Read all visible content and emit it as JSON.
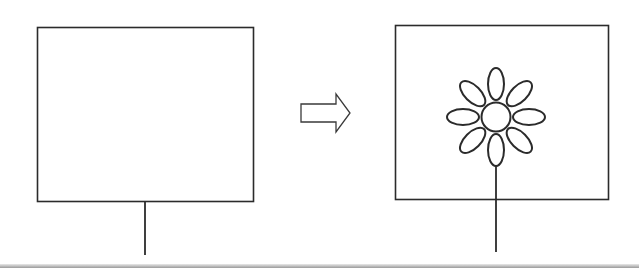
{
  "diagram": {
    "stroke_color": "#2b2b2b",
    "before": {
      "label": "empty frame on stem"
    },
    "transition": {
      "icon": "right-arrow-icon"
    },
    "after": {
      "label": "frame with flower",
      "petal_count": 8
    }
  }
}
